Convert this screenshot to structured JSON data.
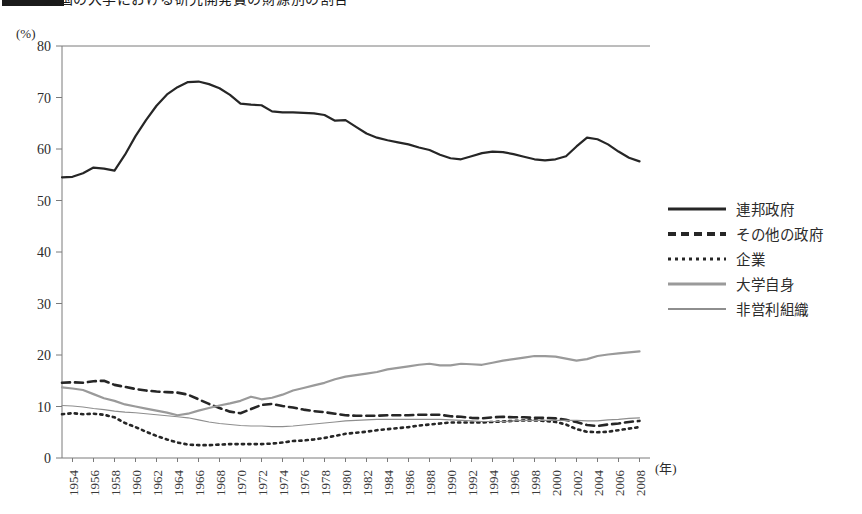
{
  "title": {
    "text": "米国の大学における研究開発費の財源別の割合",
    "badge_label": ""
  },
  "axes": {
    "y_unit": "(%)",
    "x_unit": "(年)",
    "y_ticks": [
      0,
      10,
      20,
      30,
      40,
      50,
      60,
      70,
      80
    ],
    "x_ticks": [
      1954,
      1956,
      1958,
      1960,
      1962,
      1964,
      1966,
      1968,
      1970,
      1972,
      1974,
      1976,
      1978,
      1980,
      1982,
      1984,
      1986,
      1988,
      1990,
      1992,
      1994,
      1996,
      1998,
      2000,
      2002,
      2004,
      2006,
      2008
    ]
  },
  "legend": {
    "position": "right",
    "items": [
      {
        "label": "連邦政府",
        "style": "solid-dark",
        "color": "#262626"
      },
      {
        "label": "その他の政府",
        "style": "dashed",
        "color": "#262626"
      },
      {
        "label": "企業",
        "style": "dotted",
        "color": "#262626"
      },
      {
        "label": "大学自身",
        "style": "gray-thick",
        "color": "#9a9a9a"
      },
      {
        "label": "非営利組織",
        "style": "gray-thin",
        "color": "#8e8e8e"
      }
    ]
  },
  "chart_data": {
    "type": "line",
    "title": "米国の大学における研究開発費の財源別の割合",
    "xlabel": "(年)",
    "ylabel": "(%)",
    "xlim": [
      1953,
      2009
    ],
    "ylim": [
      0,
      80
    ],
    "grid": false,
    "legend_position": "right",
    "x": [
      1953,
      1954,
      1955,
      1956,
      1957,
      1958,
      1959,
      1960,
      1961,
      1962,
      1963,
      1964,
      1965,
      1966,
      1967,
      1968,
      1969,
      1970,
      1971,
      1972,
      1973,
      1974,
      1975,
      1976,
      1977,
      1978,
      1979,
      1980,
      1981,
      1982,
      1983,
      1984,
      1985,
      1986,
      1987,
      1988,
      1989,
      1990,
      1991,
      1992,
      1993,
      1994,
      1995,
      1996,
      1997,
      1998,
      1999,
      2000,
      2001,
      2002,
      2003,
      2004,
      2005,
      2006,
      2007,
      2008
    ],
    "series": [
      {
        "name": "連邦政府",
        "style": "solid-dark",
        "color": "#262626",
        "values": [
          54.5,
          54.6,
          55.3,
          56.4,
          56.2,
          55.8,
          58.9,
          62.5,
          65.6,
          68.4,
          70.6,
          72.0,
          73.0,
          73.1,
          72.6,
          71.8,
          70.5,
          68.8,
          68.6,
          68.5,
          67.3,
          67.1,
          67.1,
          67.0,
          66.9,
          66.6,
          65.5,
          65.6,
          64.3,
          63.0,
          62.2,
          61.7,
          61.3,
          60.9,
          60.3,
          59.8,
          58.9,
          58.2,
          58.0,
          58.6,
          59.2,
          59.5,
          59.4,
          59.0,
          58.5,
          58.0,
          57.8,
          58.0,
          58.6,
          60.5,
          62.2,
          61.9,
          60.9,
          59.5,
          58.3,
          57.6
        ]
      },
      {
        "name": "その他の政府",
        "style": "dashed",
        "color": "#262626",
        "values": [
          14.6,
          14.7,
          14.6,
          14.9,
          15.0,
          14.2,
          13.8,
          13.4,
          13.1,
          12.9,
          12.8,
          12.7,
          12.3,
          11.4,
          10.5,
          9.7,
          9.0,
          8.7,
          9.5,
          10.3,
          10.5,
          10.1,
          9.8,
          9.4,
          9.1,
          8.9,
          8.6,
          8.3,
          8.2,
          8.2,
          8.2,
          8.3,
          8.3,
          8.3,
          8.4,
          8.4,
          8.4,
          8.1,
          8.0,
          7.8,
          7.7,
          7.9,
          8.0,
          7.9,
          7.9,
          7.8,
          7.8,
          7.7,
          7.4,
          7.0,
          6.4,
          6.2,
          6.5,
          6.7,
          7.0,
          7.2
        ]
      },
      {
        "name": "企業",
        "style": "dotted",
        "color": "#262626",
        "values": [
          8.5,
          8.7,
          8.5,
          8.6,
          8.4,
          7.9,
          6.8,
          6.0,
          5.1,
          4.3,
          3.6,
          3.0,
          2.6,
          2.5,
          2.5,
          2.6,
          2.7,
          2.7,
          2.7,
          2.7,
          2.8,
          3.0,
          3.3,
          3.4,
          3.6,
          3.9,
          4.3,
          4.7,
          4.9,
          5.1,
          5.4,
          5.6,
          5.8,
          6.0,
          6.3,
          6.5,
          6.7,
          6.9,
          6.9,
          6.9,
          6.9,
          7.0,
          7.1,
          7.2,
          7.3,
          7.3,
          7.2,
          7.0,
          6.5,
          5.6,
          5.1,
          5.0,
          5.1,
          5.4,
          5.7,
          6.0
        ]
      },
      {
        "name": "大学自身",
        "style": "gray-thick",
        "color": "#9a9a9a",
        "values": [
          13.7,
          13.5,
          13.2,
          12.4,
          11.6,
          11.1,
          10.4,
          10.0,
          9.6,
          9.2,
          8.8,
          8.3,
          8.6,
          9.2,
          9.7,
          10.2,
          10.6,
          11.1,
          11.9,
          11.4,
          11.7,
          12.3,
          13.1,
          13.6,
          14.1,
          14.6,
          15.3,
          15.8,
          16.1,
          16.4,
          16.7,
          17.2,
          17.5,
          17.8,
          18.1,
          18.3,
          18.0,
          18.0,
          18.3,
          18.2,
          18.1,
          18.5,
          18.9,
          19.2,
          19.5,
          19.8,
          19.8,
          19.7,
          19.3,
          18.9,
          19.2,
          19.8,
          20.1,
          20.3,
          20.5,
          20.7
        ]
      },
      {
        "name": "非営利組織",
        "style": "gray-thin",
        "color": "#8e8e8e",
        "values": [
          10.2,
          10.1,
          9.9,
          9.6,
          9.4,
          9.1,
          8.9,
          8.8,
          8.6,
          8.4,
          8.2,
          8.0,
          7.8,
          7.4,
          7.0,
          6.7,
          6.5,
          6.3,
          6.2,
          6.2,
          6.1,
          6.1,
          6.2,
          6.4,
          6.6,
          6.8,
          7.0,
          7.2,
          7.3,
          7.4,
          7.5,
          7.5,
          7.5,
          7.5,
          7.5,
          7.5,
          7.5,
          7.4,
          7.3,
          7.2,
          7.1,
          7.1,
          7.1,
          7.2,
          7.3,
          7.3,
          7.3,
          7.3,
          7.3,
          7.3,
          7.2,
          7.2,
          7.4,
          7.5,
          7.7,
          7.8
        ]
      }
    ]
  }
}
